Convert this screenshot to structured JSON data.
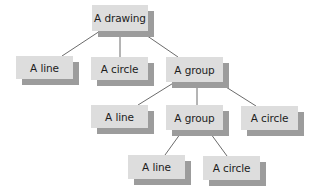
{
  "diagram": {
    "colors": {
      "node_fill": "#dddddd",
      "node_shadow": "#9c9c9c",
      "connector": "#5a5a5a",
      "text": "#1c1c1c"
    },
    "nodes": [
      {
        "id": "drawing",
        "label": "A drawing",
        "x": 92,
        "y": 5,
        "w": 56,
        "h": 26
      },
      {
        "id": "line1",
        "label": "A line",
        "x": 16,
        "y": 56,
        "w": 57,
        "h": 23
      },
      {
        "id": "circle1",
        "label": "A circle",
        "x": 91,
        "y": 57,
        "w": 57,
        "h": 23
      },
      {
        "id": "group1",
        "label": "A group",
        "x": 166,
        "y": 57,
        "w": 57,
        "h": 25
      },
      {
        "id": "line2",
        "label": "A line",
        "x": 91,
        "y": 105,
        "w": 57,
        "h": 23
      },
      {
        "id": "group2",
        "label": "A group",
        "x": 166,
        "y": 105,
        "w": 57,
        "h": 25
      },
      {
        "id": "circle2",
        "label": "A circle",
        "x": 241,
        "y": 106,
        "w": 57,
        "h": 24
      },
      {
        "id": "line3",
        "label": "A line",
        "x": 128,
        "y": 155,
        "w": 57,
        "h": 24
      },
      {
        "id": "circle3",
        "label": "A circle",
        "x": 203,
        "y": 156,
        "w": 57,
        "h": 24
      }
    ],
    "edges": [
      {
        "from": "drawing",
        "to": "line1",
        "x1": 100,
        "y1": 31,
        "x2": 62,
        "y2": 56
      },
      {
        "from": "drawing",
        "to": "circle1",
        "x1": 120,
        "y1": 31,
        "x2": 120,
        "y2": 57
      },
      {
        "from": "drawing",
        "to": "group1",
        "x1": 140,
        "y1": 31,
        "x2": 178,
        "y2": 57
      },
      {
        "from": "group1",
        "to": "line2",
        "x1": 175,
        "y1": 82,
        "x2": 138,
        "y2": 105
      },
      {
        "from": "group1",
        "to": "group2",
        "x1": 197,
        "y1": 82,
        "x2": 197,
        "y2": 105
      },
      {
        "from": "group1",
        "to": "circle2",
        "x1": 218,
        "y1": 82,
        "x2": 256,
        "y2": 106
      },
      {
        "from": "group2",
        "to": "line3",
        "x1": 183,
        "y1": 130,
        "x2": 165,
        "y2": 155
      },
      {
        "from": "group2",
        "to": "circle3",
        "x1": 208,
        "y1": 130,
        "x2": 227,
        "y2": 156
      }
    ]
  }
}
